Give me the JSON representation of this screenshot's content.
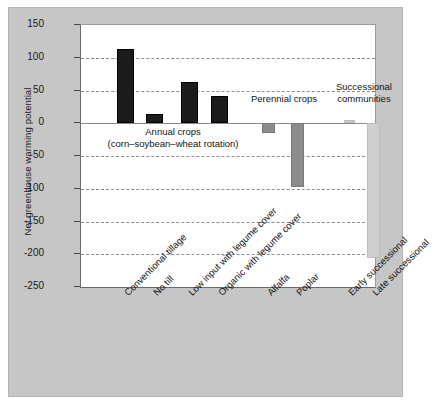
{
  "chart_data": {
    "type": "bar",
    "title": "",
    "xlabel": "",
    "ylabel": "Net greenhouse warming potential",
    "ylim": [
      -250,
      150
    ],
    "ytick_labels": [
      "150",
      "100",
      "50",
      "0",
      "-50",
      "-100",
      "-150",
      "-200",
      "-250"
    ],
    "ytick_values": [
      150,
      100,
      50,
      0,
      -50,
      -100,
      -150,
      -200,
      -250
    ],
    "grid": "horizontal dashed gridlines at every 50 units except 0 which is a solid zero line",
    "legend": "none",
    "categories": [
      "Conventional tillage",
      "No till",
      "Low input with legume cover",
      "Organic with legume cover",
      "Alfalfa",
      "Poplar",
      "Early successional",
      "Late successional"
    ],
    "values": [
      114,
      14,
      63,
      41,
      -15,
      -98,
      5,
      -205
    ],
    "bar_colors": [
      "#1b1b1b",
      "#1b1b1b",
      "#1b1b1b",
      "#1b1b1b",
      "#8c8c8c",
      "#8c8c8c",
      "#cfcfcf",
      "#cfcfcf"
    ],
    "groups": [
      {
        "label_line1": "Annual crops",
        "label_line2": "(corn–soybean–wheat rotation)",
        "members": [
          "Conventional tillage",
          "No till",
          "Low input with legume cover",
          "Organic with legume cover"
        ]
      },
      {
        "label_line1": "Perennial crops",
        "label_line2": "",
        "members": [
          "Alfalfa",
          "Poplar"
        ]
      },
      {
        "label_line1": "Successional",
        "label_line2": "communities",
        "members": [
          "Early successional",
          "Late successional"
        ]
      }
    ]
  },
  "colors": {
    "canvas": "#c6c6c6",
    "plot_background": "#ffffff",
    "axis": "#6a6a6a",
    "gridline": "#8e8e8e",
    "annual_crops": "#1b1b1b",
    "perennial_crops": "#8c8c8c",
    "successional": "#cfcfcf"
  }
}
